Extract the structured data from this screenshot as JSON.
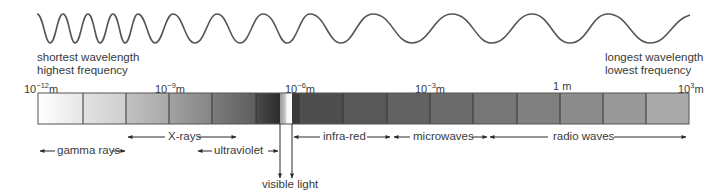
{
  "wave": {
    "left_caption": [
      "shortest wavelength",
      "highest frequency"
    ],
    "right_caption": [
      "longest wavelength",
      "lowest frequency"
    ]
  },
  "scale": {
    "ticks": [
      {
        "base": "10",
        "exp": "−12",
        "unit": "m",
        "x": 38
      },
      {
        "base": "10",
        "exp": "−9",
        "unit": "m",
        "x": 169
      },
      {
        "base": "10",
        "exp": "−6",
        "unit": "m",
        "x": 299
      },
      {
        "base": "10",
        "exp": "−3",
        "unit": "m",
        "x": 430
      },
      {
        "base": "",
        "exp": "",
        "unit": "1 m",
        "x": 560
      },
      {
        "base": "10",
        "exp": "3",
        "unit": "m",
        "x": 689
      }
    ]
  },
  "bands": {
    "gamma": "gamma rays",
    "xrays": "X-rays",
    "ultraviolet": "ultraviolet",
    "visible": "visible light",
    "infrared": "infra-red",
    "microwaves": "microwaves",
    "radio": "radio waves"
  },
  "colors": {
    "ink": "#3a3a3a",
    "bar_segments": [
      "#f4f4f4",
      "#dcdcdc",
      "#b9b9b9",
      "#9d9d9d",
      "#7a7a7a",
      "#5a5a5a",
      "#3c3c3c",
      "#555555",
      "#5c5c5c",
      "#666666",
      "#707070",
      "#7b7b7b",
      "#888888",
      "#959595",
      "#a5a5a5"
    ]
  }
}
